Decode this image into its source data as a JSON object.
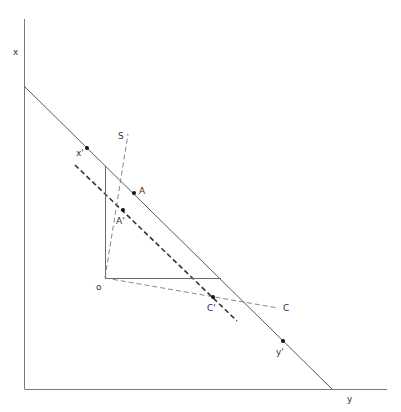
{
  "diagram": {
    "colors": {
      "axis": "#7a7a7a",
      "line": "#5a5a5a",
      "dashed_thick": "#333333",
      "dashed_thin": "#777777",
      "point": "#111111"
    },
    "axes": {
      "vertical_label": "x",
      "horizontal_label": "y"
    },
    "lines": {
      "budget_line": "solid line from x-axis to y-axis",
      "shifted_line": "thick dashed line parallel to budget line",
      "ray_S": "dashed ray from o toward S",
      "ray_C": "dashed ray from o toward C"
    },
    "labels": {
      "origin": "o",
      "x_prime": "x'",
      "y_prime": "y'",
      "A": "A",
      "A_prime": "A'",
      "C": "C",
      "C_prime": "C'",
      "S": "S"
    }
  }
}
